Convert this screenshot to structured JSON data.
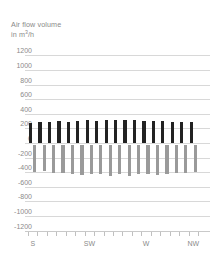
{
  "chart_data": {
    "type": "bar",
    "title": "Air flow volume",
    "subtitle": "in m³/h",
    "title_line1": "Air flow volume",
    "title_line2_prefix": "in m",
    "title_line2_sup": "3",
    "title_line2_suffix": "/h",
    "xlabel": "",
    "ylabel": "Air flow volume in m³/h",
    "ylim": [
      -1200,
      1200
    ],
    "ytick_labels": [
      "1200",
      "1000",
      "800",
      "600",
      "400",
      "200",
      "0",
      "-200",
      "-400",
      "-600",
      "-800",
      "-1000",
      "-1200"
    ],
    "ytick_values": [
      1200,
      1000,
      800,
      600,
      400,
      200,
      0,
      -200,
      -400,
      -600,
      -800,
      -1000,
      -1200
    ],
    "grid": true,
    "legend": "none",
    "xtick_labels": [
      "S",
      "SW",
      "W",
      "NW"
    ],
    "xtick_positions": [
      0,
      6,
      12,
      17
    ],
    "n_categories": 18,
    "categories": [
      "S",
      "S1",
      "S2",
      "S3",
      "S4",
      "S5",
      "SW",
      "SW1",
      "SW2",
      "SW3",
      "SW4",
      "SW5",
      "W",
      "W1",
      "W2",
      "W3",
      "W4",
      "NW"
    ],
    "series": [
      {
        "name": "Supply air flow",
        "color": "#222222",
        "values": [
          280,
          290,
          290,
          295,
          290,
          300,
          310,
          305,
          310,
          312,
          315,
          310,
          300,
          300,
          295,
          285,
          290,
          290
        ]
      },
      {
        "name": "Exhaust air flow",
        "color": "#9a9a9a",
        "values": [
          -370,
          -360,
          -385,
          -390,
          -395,
          -410,
          -400,
          -400,
          -420,
          -400,
          -425,
          -400,
          -395,
          -405,
          -400,
          -380,
          -385,
          -370
        ]
      }
    ]
  },
  "colors": {
    "positive_bar": "#222222",
    "negative_bar": "#9a9a9a",
    "gridline": "#d8d8d8",
    "axis": "#c9c9c9",
    "text": "#8a8a8a",
    "background": "#ffffff"
  }
}
